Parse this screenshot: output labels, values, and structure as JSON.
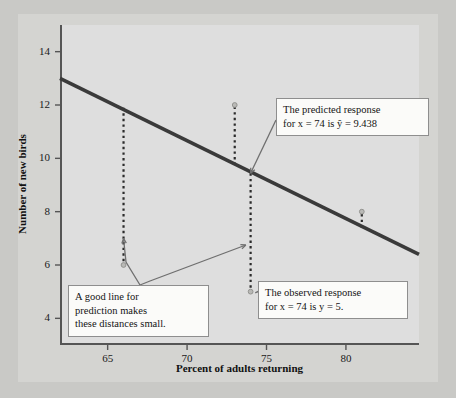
{
  "chart_data": {
    "type": "scatter",
    "title": "",
    "xlabel": "Percent of adults returning",
    "ylabel": "Number of new birds",
    "xlim": [
      62.0,
      84.6
    ],
    "ylim": [
      3.0,
      15.0
    ],
    "xticks": [
      65,
      70,
      75,
      80
    ],
    "yticks": [
      4,
      6,
      8,
      10,
      12,
      14
    ],
    "grid": false,
    "legend": null,
    "series": [
      {
        "name": "Observed data points",
        "type": "scatter",
        "points": [
          {
            "x": 66.0,
            "y": 6.0
          },
          {
            "x": 73.0,
            "y": 12.0
          },
          {
            "x": 74.0,
            "y": 5.0
          },
          {
            "x": 81.0,
            "y": 8.0
          }
        ]
      },
      {
        "name": "Least-squares regression line",
        "type": "line",
        "endpoints": [
          {
            "x": 62.0,
            "y": 13.0
          },
          {
            "x": 84.6,
            "y": 6.4
          }
        ],
        "color": "#3a3a3a"
      }
    ],
    "residual_segments": [
      {
        "x": 66.0,
        "y_line": 11.9,
        "y_point": 6.0
      },
      {
        "x": 73.0,
        "y_line": 9.75,
        "y_point": 12.0
      },
      {
        "x": 74.0,
        "y_line": 9.438,
        "y_point": 5.0
      },
      {
        "x": 81.0,
        "y_line": 7.4,
        "y_point": 8.0
      }
    ],
    "annotations": [
      {
        "id": "predicted-response",
        "lines": [
          "The predicted response",
          "for x = 74 is  ŷ = 9.438"
        ],
        "points_to": {
          "x": 74.0,
          "y": 9.438
        }
      },
      {
        "id": "observed-response",
        "lines": [
          "The observed response",
          "for x = 74  is  y = 5."
        ],
        "points_to": {
          "x": 74.0,
          "y": 5.0
        }
      },
      {
        "id": "good-line",
        "lines": [
          "A good line for",
          "prediction makes",
          "these distances small."
        ],
        "points_to": {
          "x": 66.0,
          "y": 7.0
        }
      }
    ]
  },
  "axes": {
    "x_label": "Percent of adults returning",
    "y_label": "Number of new birds",
    "x_tick_labels": [
      "65",
      "70",
      "75",
      "80"
    ],
    "y_tick_labels": [
      "4",
      "6",
      "8",
      "10",
      "12",
      "14"
    ]
  },
  "annotations": {
    "predicted": {
      "line1": "The predicted response",
      "line2": "for x = 74 is  ŷ = 9.438"
    },
    "observed": {
      "line1": "The observed response",
      "line2": "for x = 74  is  y = 5."
    },
    "good_line": {
      "line1": "A good line for",
      "line2": "prediction makes",
      "line3": "these distances small."
    }
  },
  "colors": {
    "page_background": "#c9c9c6",
    "panel_background": "#dedede",
    "axis": "#555555",
    "regression_line": "#3a3a3a",
    "residual_dashes": "#2b2b2b",
    "leader_line": "#6f6f6f",
    "callout_background": "#fbfbf9",
    "callout_border": "#8e8e8e",
    "text": "#141414"
  }
}
